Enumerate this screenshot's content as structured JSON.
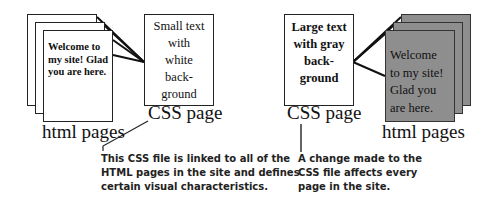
{
  "left_group": {
    "html_page_text": "Welcome to\nmy site! Glad\nyou are here.",
    "html_pages_label": "html pages",
    "css_box_text": "Small text\nwith\nwhite\nback-\nground",
    "css_page_label": "CSS page",
    "caption": "This CSS file is linked to all of the\nHTML pages in the site and defines\ncertain visual characteristics."
  },
  "right_group": {
    "css_box_text": "Large text\nwith gray\nback-\nground",
    "css_page_label": "CSS page",
    "html_page_text": "Welcome\nto my site!\nGlad you\nare here.",
    "html_pages_label": "html pages",
    "caption": "A change made to the\nCSS file affects every\npage in the site."
  },
  "colors": {
    "page_border": "#222222",
    "gray_page_fill": "#8e8e8e",
    "background": "#ffffff"
  }
}
